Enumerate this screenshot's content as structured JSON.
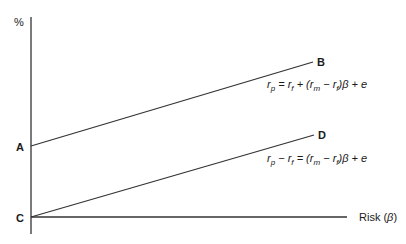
{
  "diagram": {
    "y_axis_label": "%",
    "x_axis_label_text": "Risk (",
    "x_axis_label_beta": "β",
    "x_axis_label_close": ")",
    "points": {
      "A": "A",
      "B": "B",
      "C": "C",
      "D": "D"
    },
    "equation_upper": {
      "r": "r",
      "p": "p",
      "eq": " = ",
      "rf1": "r",
      "f1": "f",
      "plus": " + (",
      "rm": "r",
      "m": "m",
      "minus": " − ",
      "rf2": "r",
      "f2": "f",
      "tail": ")β + e"
    },
    "equation_lower": {
      "r": "r",
      "p": "p",
      "minus1": " − ",
      "rf1": "r",
      "f1": "f",
      "eq": " = (",
      "rm": "r",
      "m": "m",
      "minus2": " − ",
      "rf2": "r",
      "f2": "f",
      "tail": ")β + e"
    },
    "lines": [
      {
        "name": "A-B",
        "from": [
          31,
          146
        ],
        "to": [
          313,
          62
        ]
      },
      {
        "name": "C-D",
        "from": [
          31,
          217
        ],
        "to": [
          314,
          135
        ]
      }
    ]
  }
}
